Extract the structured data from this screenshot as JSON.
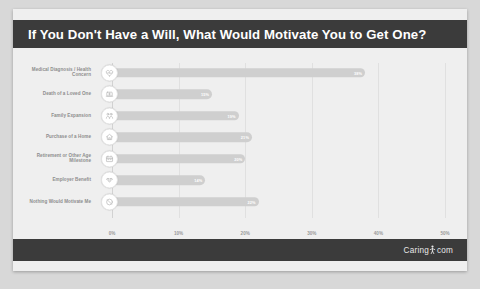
{
  "header": {
    "title": "If You Don't Have a Will, What Would Motivate You to Get One?"
  },
  "footer": {
    "brand_left": "Caring",
    "brand_right": "com",
    "brand_mark": "person-icon"
  },
  "colors": {
    "header_bg": "#3b3b3b",
    "footer_bg": "#3b3b3b",
    "card_bg": "#efefef",
    "bar": "#cfcfcf",
    "bar_label": "#ffffff",
    "category_label": "#8d8d8d",
    "axis_label": "#9a9a9a",
    "gridline": "#e0e0e0",
    "badge_bg": "#ffffff"
  },
  "chart_data": {
    "type": "bar",
    "orientation": "horizontal",
    "title": "If You Don't Have a Will, What Would Motivate You to Get One?",
    "xlabel": "",
    "ylabel": "",
    "xlim": [
      0,
      50
    ],
    "grid": true,
    "legend": false,
    "xticks": [
      "0%",
      "10%",
      "20%",
      "30%",
      "40%",
      "50%"
    ],
    "xtick_values": [
      0,
      10,
      20,
      30,
      40,
      50
    ],
    "categories": [
      "Medical Diagnosis / Health Concern",
      "Death of a Loved One",
      "Family Expansion",
      "Purchase of a Home",
      "Retirement or Other Age Milestone",
      "Employer Benefit",
      "Nothing Would Motivate Me"
    ],
    "values": [
      38,
      15,
      19,
      21,
      20,
      14,
      22
    ],
    "value_labels": [
      "38%",
      "15%",
      "19%",
      "21%",
      "20%",
      "14%",
      "22%"
    ],
    "icons": [
      "heart-health-icon",
      "tombstone-icon",
      "family-icon",
      "house-icon",
      "calendar-icon",
      "handshake-icon",
      "blocked-icon"
    ]
  }
}
